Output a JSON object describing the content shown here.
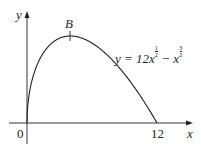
{
  "chart_data": {
    "type": "line",
    "title": "",
    "xlabel": "x",
    "ylabel": "y",
    "equation": "y = 12x^(1/2) - x^(3/2)",
    "x_ticks": [
      "0",
      "12"
    ],
    "xlim": [
      0,
      12.8
    ],
    "ylim": [
      0,
      19
    ],
    "grid": false,
    "legend": "none",
    "series": [
      {
        "name": "y = 12x^(1/2) - x^(3/2)",
        "x": [
          0,
          0.25,
          0.5,
          1,
          2,
          3,
          4,
          5,
          6,
          7,
          8,
          9,
          10,
          11,
          12
        ],
        "y": [
          0,
          5.88,
          8.13,
          11,
          14.14,
          15.59,
          16,
          15.65,
          14.7,
          13.23,
          11.31,
          9,
          6.32,
          3.32,
          0
        ]
      }
    ],
    "annotations": [
      {
        "label": "B",
        "x": 4,
        "y": 16,
        "note": "maximum point"
      }
    ],
    "color": "#231f20"
  },
  "labels": {
    "y_axis": "y",
    "x_axis": "x",
    "origin": "0",
    "x_intercept": "12",
    "point_b": "B",
    "eq_lhs": "y = 12x",
    "eq_minus": " − x",
    "exp1_num": "1",
    "exp1_den": "2",
    "exp2_num": "3",
    "exp2_den": "2"
  }
}
